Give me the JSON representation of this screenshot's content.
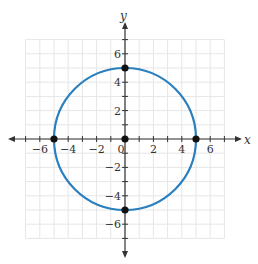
{
  "chart_data": {
    "type": "scatter",
    "title": "",
    "subtitle": "Circle x^2 + y^2 = 25",
    "xlabel": "x",
    "ylabel": "y",
    "xlim": [
      -7,
      7
    ],
    "ylim": [
      -7,
      7
    ],
    "grid": true,
    "x_ticks": [
      -6,
      -4,
      -2,
      0,
      2,
      4,
      6
    ],
    "y_ticks": [
      -6,
      -4,
      -2,
      2,
      4,
      6
    ],
    "x_tick_labels": [
      "−6",
      "−4",
      "−2",
      "0",
      "2",
      "4",
      "6"
    ],
    "y_tick_labels": [
      "−6",
      "−4",
      "−2",
      "2",
      "4",
      "6"
    ],
    "series": [
      {
        "name": "circle",
        "kind": "curve",
        "center": [
          0,
          0
        ],
        "radius": 5,
        "color": "#2a7fbf"
      },
      {
        "name": "points",
        "kind": "points",
        "x": [
          0,
          5,
          -5,
          0,
          0
        ],
        "y": [
          0,
          0,
          0,
          5,
          -5
        ],
        "color": "#111111"
      }
    ],
    "legend": null
  },
  "colors": {
    "grid": "#e6e6e6",
    "axis": "#333333",
    "curve": "#2a7fbf",
    "point": "#111111"
  }
}
